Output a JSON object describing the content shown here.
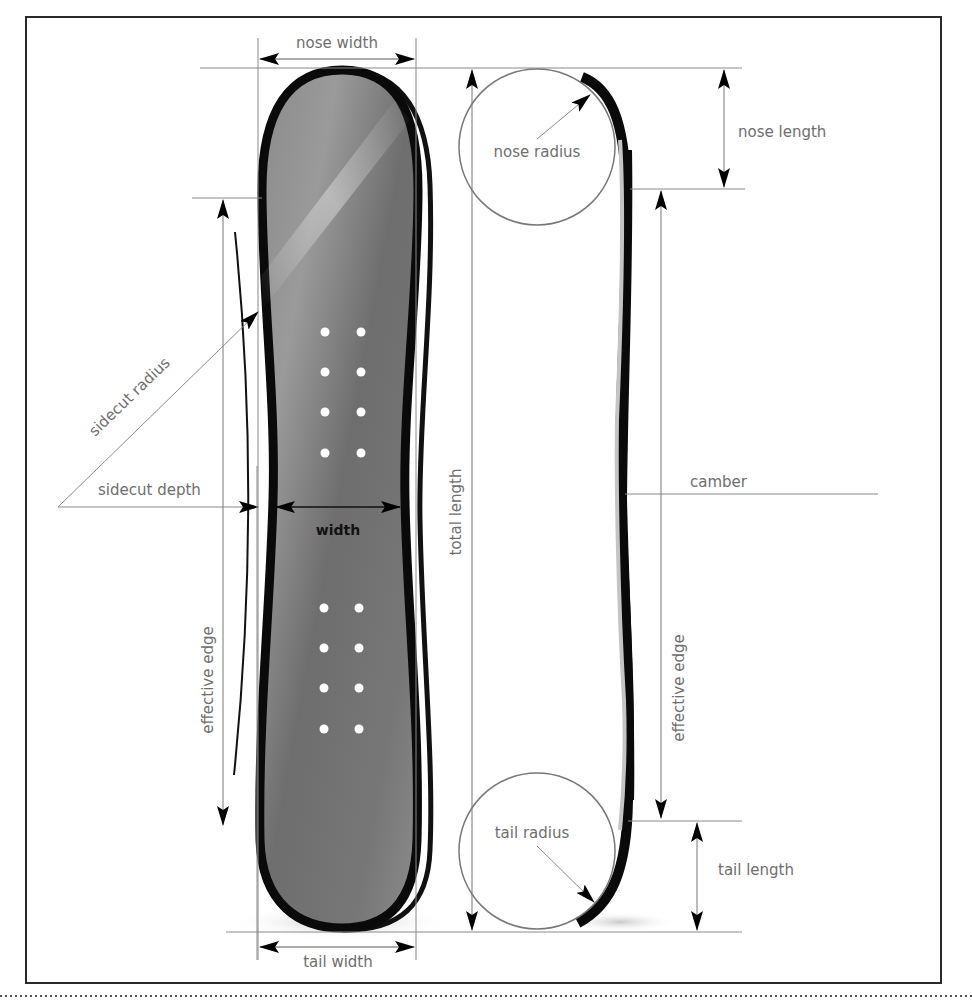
{
  "diagram": {
    "labels": {
      "nose_width": "nose width",
      "tail_width": "tail width",
      "nose_radius": "nose radius",
      "tail_radius": "tail radius",
      "nose_length": "nose length",
      "tail_length": "tail length",
      "sidecut_radius": "sidecut radius",
      "sidecut_depth": "sidecut depth",
      "width": "width",
      "total_length": "total length",
      "effective_edge_left": "effective edge",
      "effective_edge_right": "effective edge",
      "camber": "camber"
    },
    "colors": {
      "board_outline": "#0a0a0a",
      "board_fill": "#7a7a7a",
      "board_highlight": "#c8c8c8",
      "profile_core": "#c4c4c4",
      "dimension_line": "#8a8a8a",
      "label_text": "#6e6e6e",
      "frame": "#2a2a2a"
    },
    "insert_holes": {
      "top_group_rows": 4,
      "bottom_group_rows": 4,
      "columns": 2
    }
  }
}
